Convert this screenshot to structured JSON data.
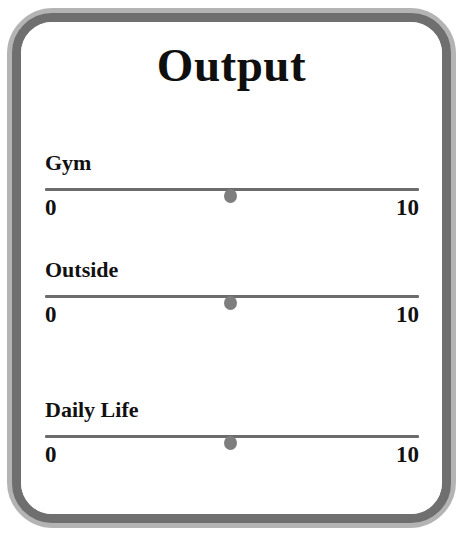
{
  "card": {
    "title": "Output",
    "frame_color": "#6f6f6f",
    "frame_edge_color": "#b4b4b4",
    "background_color": "#ffffff",
    "text_color": "#121111"
  },
  "sliders": [
    {
      "label": "Gym",
      "min_label": "0",
      "max_label": "10",
      "value_percent": 49.7,
      "knob_color": "#7e7e7e",
      "track_color": "#6c6c6c"
    },
    {
      "label": "Outside",
      "min_label": "0",
      "max_label": "10",
      "value_percent": 49.7,
      "knob_color": "#7e7e7e",
      "track_color": "#6c6c6c"
    },
    {
      "label": "Daily Life",
      "min_label": "0",
      "max_label": "10",
      "value_percent": 49.7,
      "knob_color": "#7e7e7e",
      "track_color": "#6c6c6c"
    }
  ]
}
